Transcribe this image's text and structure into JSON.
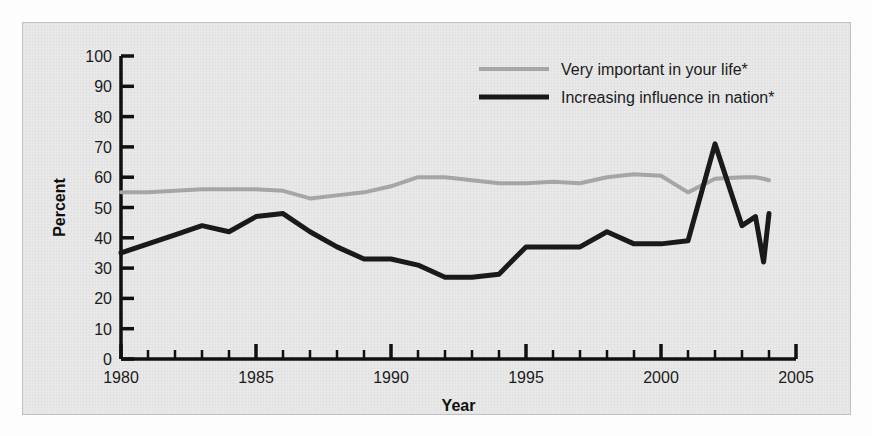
{
  "chart_data": {
    "type": "line",
    "title": "",
    "xlabel": "Year",
    "ylabel": "Percent",
    "xlim": [
      1980,
      2005
    ],
    "ylim": [
      0,
      100
    ],
    "grid": false,
    "legend_position": "top-right",
    "x_tick_labels": [
      "1980",
      "1985",
      "1990",
      "1995",
      "2000",
      "2005"
    ],
    "x_major_ticks": [
      1980,
      1985,
      1990,
      1995,
      2000,
      2005
    ],
    "x_minor_tick_step": 1,
    "y_tick_labels": [
      "0",
      "10",
      "20",
      "30",
      "40",
      "50",
      "60",
      "70",
      "80",
      "90",
      "100"
    ],
    "y_major_ticks": [
      0,
      10,
      20,
      30,
      40,
      50,
      60,
      70,
      80,
      90,
      100
    ],
    "x": [
      1980,
      1981,
      1982,
      1983,
      1984,
      1985,
      1986,
      1987,
      1988,
      1989,
      1990,
      1991,
      1992,
      1993,
      1994,
      1995,
      1996,
      1997,
      1998,
      1999,
      2000,
      2001,
      2002,
      2003,
      2003.5,
      2003.8,
      2004
    ],
    "series": [
      {
        "name": "Very important in your life*",
        "color": "#a8a8a8",
        "line_width": 4,
        "values": [
          55,
          55,
          55.5,
          56,
          56,
          56,
          55.5,
          53,
          54,
          55,
          57,
          60,
          60,
          59,
          58,
          58,
          58.5,
          58,
          60,
          61,
          60.5,
          55,
          59.5,
          60,
          60,
          59.5,
          59
        ]
      },
      {
        "name": "Increasing influence in nation*",
        "color": "#1a1a1a",
        "line_width": 5,
        "values": [
          35,
          38,
          41,
          44,
          42,
          47,
          48,
          42,
          37,
          33,
          33,
          31,
          27,
          27,
          28,
          37,
          37,
          37,
          42,
          38,
          38,
          39,
          71,
          44,
          47,
          32,
          48
        ]
      }
    ]
  },
  "legend": {
    "items": [
      {
        "label": "Very important in your life*",
        "color": "#a8a8a8"
      },
      {
        "label": "Increasing influence in nation*",
        "color": "#1a1a1a"
      }
    ]
  },
  "axes": {
    "x_title": "Year",
    "y_title": "Percent"
  }
}
